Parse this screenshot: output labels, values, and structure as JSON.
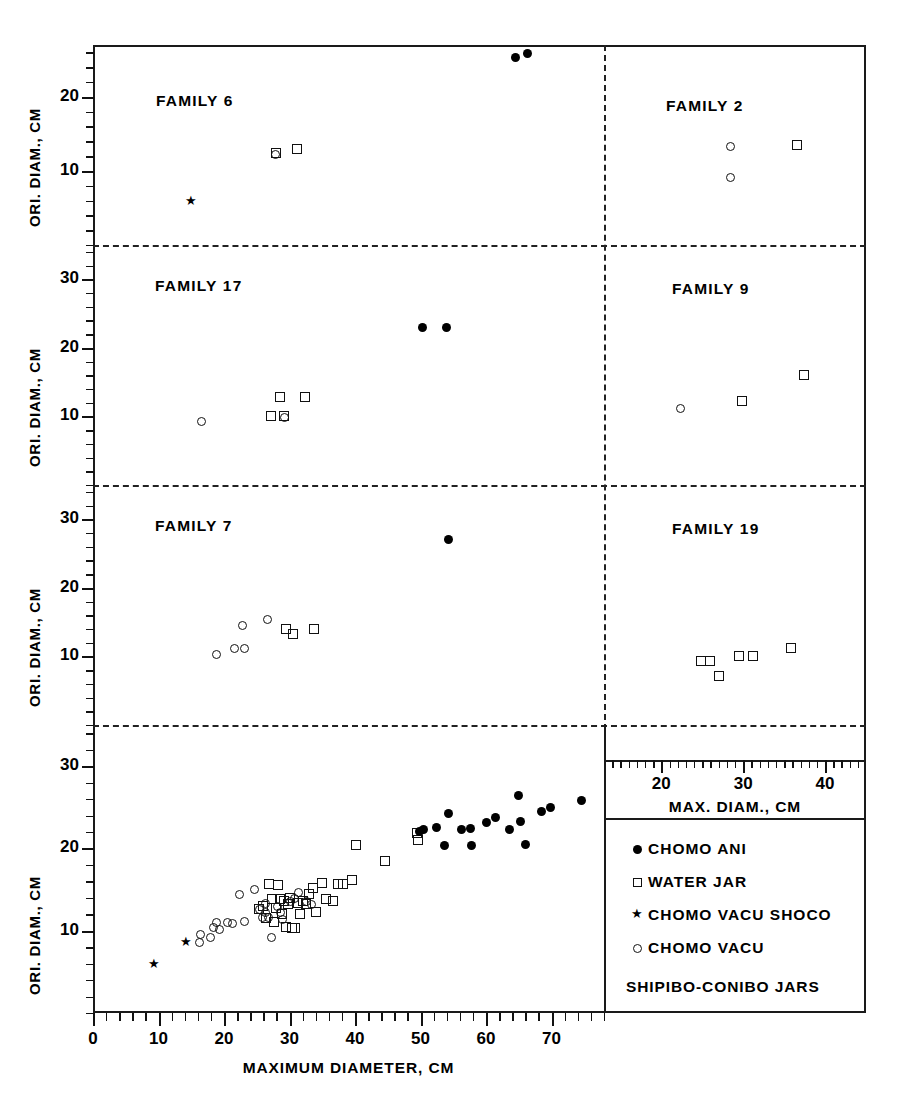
{
  "figure": {
    "caption": "SHIPIBO-CONIBO JARS",
    "x_axis_main": {
      "title": "MAXIMUM DIAMETER, CM",
      "ticks": [
        0,
        10,
        20,
        30,
        40,
        50,
        60,
        70
      ],
      "range": [
        0,
        78
      ]
    },
    "x_axis_right": {
      "title": "MAX. DIAM., CM",
      "ticks": [
        20,
        30,
        40
      ],
      "range": [
        13,
        45
      ]
    },
    "y_axis_title": "ORI. DIAM., CM"
  },
  "legend": {
    "position": "bottom-right",
    "entries": [
      {
        "symbol": "filled-circle",
        "label": "CHOMO ANI"
      },
      {
        "symbol": "open-square",
        "label": "WATER JAR"
      },
      {
        "symbol": "star",
        "label": "CHOMO VACU SHOCO"
      },
      {
        "symbol": "open-circle",
        "label": "CHOMO VACU"
      }
    ]
  },
  "chart_data": {
    "type": "scatter",
    "title": "SHIPIBO-CONIBO JARS",
    "xlabel": "MAXIMUM DIAMETER, CM",
    "ylabel": "ORI. DIAM., CM",
    "grid": false,
    "panels": [
      {
        "name": "FAMILY 6",
        "row": 0,
        "col": 0,
        "xlim": [
          0,
          78
        ],
        "ylim": [
          0,
          27
        ],
        "yticks": [
          10,
          20
        ],
        "series": [
          {
            "name": "CHOMO ANI",
            "symbol": "filled-circle",
            "points": [
              [
                64.5,
                25.3
              ],
              [
                66.3,
                25.9
              ]
            ]
          },
          {
            "name": "WATER JAR",
            "symbol": "open-square",
            "points": [
              [
                28.0,
                12.4
              ],
              [
                31.2,
                12.9
              ]
            ]
          },
          {
            "name": "CHOMO VACU",
            "symbol": "open-circle",
            "points": [
              [
                27.8,
                12.2
              ]
            ]
          },
          {
            "name": "CHOMO VACU SHOCO",
            "symbol": "star",
            "points": [
              [
                15.0,
                5.8
              ]
            ]
          }
        ]
      },
      {
        "name": "FAMILY 2",
        "row": 0,
        "col": 1,
        "xlim": [
          13,
          45
        ],
        "ylim": [
          0,
          27
        ],
        "series": [
          {
            "name": "WATER JAR",
            "symbol": "open-square",
            "points": [
              [
                36.6,
                13.5
              ]
            ]
          },
          {
            "name": "CHOMO VACU",
            "symbol": "open-circle",
            "points": [
              [
                28.5,
                13.3
              ],
              [
                28.4,
                9.1
              ]
            ]
          }
        ]
      },
      {
        "name": "FAMILY 17",
        "row": 1,
        "col": 0,
        "xlim": [
          0,
          78
        ],
        "ylim": [
          0,
          35
        ],
        "yticks": [
          10,
          20,
          30
        ],
        "series": [
          {
            "name": "CHOMO ANI",
            "symbol": "filled-circle",
            "points": [
              [
                50.3,
                23.0
              ],
              [
                54.0,
                23.0
              ]
            ]
          },
          {
            "name": "WATER JAR",
            "symbol": "open-square",
            "points": [
              [
                28.6,
                12.8
              ],
              [
                32.4,
                12.8
              ],
              [
                27.2,
                10.0
              ],
              [
                29.2,
                10.0
              ]
            ]
          },
          {
            "name": "CHOMO VACU",
            "symbol": "open-circle",
            "points": [
              [
                16.5,
                9.2
              ],
              [
                29.3,
                9.9
              ]
            ]
          }
        ]
      },
      {
        "name": "FAMILY 9",
        "row": 1,
        "col": 1,
        "xlim": [
          13,
          45
        ],
        "ylim": [
          0,
          35
        ],
        "series": [
          {
            "name": "WATER JAR",
            "symbol": "open-square",
            "points": [
              [
                29.8,
                12.2
              ],
              [
                37.4,
                16.0
              ]
            ]
          },
          {
            "name": "CHOMO VACU",
            "symbol": "open-circle",
            "points": [
              [
                22.3,
                11.2
              ]
            ]
          }
        ]
      },
      {
        "name": "FAMILY 7",
        "row": 2,
        "col": 0,
        "xlim": [
          0,
          78
        ],
        "ylim": [
          0,
          35
        ],
        "yticks": [
          10,
          20,
          30
        ],
        "series": [
          {
            "name": "CHOMO ANI",
            "symbol": "filled-circle",
            "points": [
              [
                54.3,
                27.0
              ]
            ]
          },
          {
            "name": "WATER JAR",
            "symbol": "open-square",
            "points": [
              [
                29.5,
                14.0
              ],
              [
                30.5,
                13.3
              ],
              [
                33.8,
                14.0
              ]
            ]
          },
          {
            "name": "CHOMO VACU",
            "symbol": "open-circle",
            "points": [
              [
                22.8,
                14.5
              ],
              [
                26.6,
                15.4
              ],
              [
                18.8,
                10.3
              ],
              [
                21.6,
                11.2
              ],
              [
                23.2,
                11.2
              ]
            ]
          }
        ]
      },
      {
        "name": "FAMILY 19",
        "row": 2,
        "col": 1,
        "xlim": [
          13,
          45
        ],
        "ylim": [
          0,
          35
        ],
        "series": [
          {
            "name": "WATER JAR",
            "symbol": "open-square",
            "points": [
              [
                24.8,
                12.6
              ],
              [
                25.9,
                12.6
              ],
              [
                27.1,
                10.7
              ],
              [
                29.5,
                13.2
              ],
              [
                31.2,
                13.2
              ],
              [
                35.8,
                14.2
              ]
            ]
          }
        ]
      },
      {
        "name": "MAIN",
        "row": 3,
        "col": 0,
        "xlim": [
          0,
          78
        ],
        "ylim": [
          0,
          35
        ],
        "yticks": [
          10,
          20,
          30
        ],
        "series": [
          {
            "name": "CHOMO VACU SHOCO",
            "symbol": "star",
            "points": [
              [
                9.3,
                5.8
              ],
              [
                14.2,
                8.5
              ]
            ]
          },
          {
            "name": "CHOMO VACU",
            "symbol": "open-circle",
            "points": [
              [
                16.3,
                8.6
              ],
              [
                16.4,
                9.6
              ],
              [
                18.0,
                9.2
              ],
              [
                18.4,
                10.4
              ],
              [
                18.8,
                11.0
              ],
              [
                19.3,
                10.1
              ],
              [
                20.6,
                11.0
              ],
              [
                21.3,
                10.9
              ],
              [
                22.4,
                14.4
              ],
              [
                23.1,
                11.1
              ],
              [
                24.6,
                15.0
              ],
              [
                25.4,
                12.6
              ],
              [
                25.8,
                11.6
              ],
              [
                26.4,
                12.2
              ],
              [
                26.3,
                13.3
              ],
              [
                26.8,
                11.6
              ],
              [
                27.2,
                9.2
              ],
              [
                28.1,
                13.0
              ],
              [
                28.6,
                12.2
              ],
              [
                29.0,
                11.4
              ],
              [
                30.2,
                13.6
              ],
              [
                30.8,
                13.9
              ],
              [
                31.4,
                14.6
              ],
              [
                32.6,
                13.6
              ],
              [
                33.4,
                13.2
              ]
            ]
          },
          {
            "name": "WATER JAR",
            "symbol": "open-square",
            "points": [
              [
                25.3,
                12.6
              ],
              [
                26.0,
                13.0
              ],
              [
                26.4,
                11.6
              ],
              [
                26.9,
                15.7
              ],
              [
                27.3,
                13.8
              ],
              [
                27.6,
                11.0
              ],
              [
                28.0,
                12.7
              ],
              [
                28.3,
                15.6
              ],
              [
                28.6,
                13.9
              ],
              [
                28.9,
                12.0
              ],
              [
                29.2,
                13.6
              ],
              [
                29.5,
                10.5
              ],
              [
                29.8,
                13.2
              ],
              [
                30.1,
                14.0
              ],
              [
                30.4,
                10.3
              ],
              [
                30.8,
                10.3
              ],
              [
                31.3,
                13.4
              ],
              [
                31.6,
                12.0
              ],
              [
                32.1,
                13.6
              ],
              [
                32.5,
                13.2
              ],
              [
                33.0,
                14.5
              ],
              [
                33.6,
                15.2
              ],
              [
                34.1,
                12.3
              ],
              [
                34.9,
                15.8
              ],
              [
                35.6,
                13.8
              ],
              [
                36.6,
                13.6
              ],
              [
                37.4,
                15.7
              ],
              [
                38.1,
                15.7
              ],
              [
                39.6,
                16.2
              ],
              [
                40.1,
                20.4
              ],
              [
                44.6,
                18.5
              ],
              [
                49.4,
                21.9
              ],
              [
                49.6,
                21.0
              ]
            ]
          },
          {
            "name": "CHOMO ANI",
            "symbol": "filled-circle",
            "points": [
              [
                49.9,
                22.1
              ],
              [
                50.4,
                22.3
              ],
              [
                52.5,
                22.6
              ],
              [
                53.6,
                20.4
              ],
              [
                54.2,
                24.3
              ],
              [
                56.3,
                22.3
              ],
              [
                57.6,
                22.4
              ],
              [
                57.7,
                20.3
              ],
              [
                60.0,
                23.2
              ],
              [
                61.5,
                23.7
              ],
              [
                63.5,
                22.3
              ],
              [
                64.9,
                26.4
              ],
              [
                65.2,
                23.3
              ],
              [
                66.0,
                20.5
              ],
              [
                68.5,
                24.5
              ],
              [
                69.8,
                25.0
              ],
              [
                74.5,
                25.8
              ]
            ]
          }
        ]
      }
    ]
  }
}
